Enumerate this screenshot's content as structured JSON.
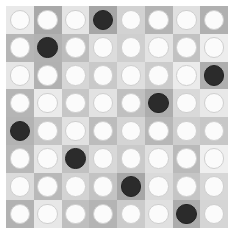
{
  "board": {
    "title": "8x8 disc grid",
    "rows": 8,
    "cols": 8,
    "margin_px": 6,
    "cell_size_px": 27.75,
    "background_color": "#ffffff",
    "disc_colors": {
      "light": "#fbfbfb",
      "light_border": "#cfcfcf",
      "dark": "#2b2b2b",
      "dark_border": "#222222"
    },
    "dark_disc_positions": [
      {
        "row": 1,
        "col": 4
      },
      {
        "row": 2,
        "col": 2
      },
      {
        "row": 3,
        "col": 8
      },
      {
        "row": 4,
        "col": 6
      },
      {
        "row": 5,
        "col": 1
      },
      {
        "row": 6,
        "col": 3
      },
      {
        "row": 7,
        "col": 5
      },
      {
        "row": 8,
        "col": 7
      }
    ],
    "dark_count": 8,
    "light_count": 56,
    "cells": [
      [
        {
          "disc": "light",
          "bg": "#e9e9e9"
        },
        {
          "disc": "light",
          "bg": "#a9a9a9"
        },
        {
          "disc": "light",
          "bg": "#e4e4e4"
        },
        {
          "disc": "dark",
          "bg": "#a6a6a6"
        },
        {
          "disc": "light",
          "bg": "#d2d2d2"
        },
        {
          "disc": "light",
          "bg": "#b4b4b4"
        },
        {
          "disc": "light",
          "bg": "#e0e0e0"
        },
        {
          "disc": "light",
          "bg": "#b0b0b0"
        }
      ],
      [
        {
          "disc": "light",
          "bg": "#b6b6b6"
        },
        {
          "disc": "dark",
          "bg": "#b2b2b2"
        },
        {
          "disc": "light",
          "bg": "#bdbdbd"
        },
        {
          "disc": "light",
          "bg": "#dcdcdc"
        },
        {
          "disc": "light",
          "bg": "#cfcfcf"
        },
        {
          "disc": "light",
          "bg": "#e3e3e3"
        },
        {
          "disc": "light",
          "bg": "#c2c2c2"
        },
        {
          "disc": "light",
          "bg": "#ededed"
        }
      ],
      [
        {
          "disc": "light",
          "bg": "#e6e6e6"
        },
        {
          "disc": "light",
          "bg": "#b1b1b1"
        },
        {
          "disc": "light",
          "bg": "#d6d6d6"
        },
        {
          "disc": "light",
          "bg": "#c9c9c9"
        },
        {
          "disc": "light",
          "bg": "#dedede"
        },
        {
          "disc": "light",
          "bg": "#cccccc"
        },
        {
          "disc": "light",
          "bg": "#ebebeb"
        },
        {
          "disc": "dark",
          "bg": "#aeaeae"
        }
      ],
      [
        {
          "disc": "light",
          "bg": "#b5b5b5"
        },
        {
          "disc": "light",
          "bg": "#eaeaea"
        },
        {
          "disc": "light",
          "bg": "#c6c6c6"
        },
        {
          "disc": "light",
          "bg": "#e2e2e2"
        },
        {
          "disc": "light",
          "bg": "#c0c0c0"
        },
        {
          "disc": "dark",
          "bg": "#adadad"
        },
        {
          "disc": "light",
          "bg": "#d9d9d9"
        },
        {
          "disc": "light",
          "bg": "#e8e8e8"
        }
      ],
      [
        {
          "disc": "dark",
          "bg": "#b3b3b3"
        },
        {
          "disc": "light",
          "bg": "#c4c4c4"
        },
        {
          "disc": "light",
          "bg": "#e1e1e1"
        },
        {
          "disc": "light",
          "bg": "#bcbcbc"
        },
        {
          "disc": "light",
          "bg": "#d4d4d4"
        },
        {
          "disc": "light",
          "bg": "#b7b7b7"
        },
        {
          "disc": "light",
          "bg": "#cecece"
        },
        {
          "disc": "light",
          "bg": "#c7c7c7"
        }
      ],
      [
        {
          "disc": "light",
          "bg": "#b8b8b8"
        },
        {
          "disc": "light",
          "bg": "#e5e5e5"
        },
        {
          "disc": "dark",
          "bg": "#c1c1c1"
        },
        {
          "disc": "light",
          "bg": "#d8d8d8"
        },
        {
          "disc": "light",
          "bg": "#cacaca"
        },
        {
          "disc": "light",
          "bg": "#dfdfdf"
        },
        {
          "disc": "light",
          "bg": "#bababa"
        },
        {
          "disc": "light",
          "bg": "#efefef"
        }
      ],
      [
        {
          "disc": "light",
          "bg": "#dbdbdb"
        },
        {
          "disc": "light",
          "bg": "#b9b9b9"
        },
        {
          "disc": "light",
          "bg": "#d3d3d3"
        },
        {
          "disc": "light",
          "bg": "#c3c3c3"
        },
        {
          "disc": "dark",
          "bg": "#a7a7a7"
        },
        {
          "disc": "light",
          "bg": "#dadada"
        },
        {
          "disc": "light",
          "bg": "#c5c5c5"
        },
        {
          "disc": "light",
          "bg": "#d7d7d7"
        }
      ],
      [
        {
          "disc": "light",
          "bg": "#b2b2b2"
        },
        {
          "disc": "light",
          "bg": "#e7e7e7"
        },
        {
          "disc": "light",
          "bg": "#bfbfbf"
        },
        {
          "disc": "light",
          "bg": "#ddddddd"
        },
        {
          "disc": "light",
          "bg": "#cbcbcb"
        },
        {
          "disc": "light",
          "bg": "#e0e0e0"
        },
        {
          "disc": "dark",
          "bg": "#acacac"
        },
        {
          "disc": "light",
          "bg": "#d5d5d5"
        }
      ]
    ]
  }
}
